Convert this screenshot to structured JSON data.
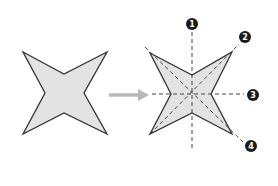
{
  "diagram": {
    "colors": {
      "fill": "#e3e3e3",
      "stroke": "#333333",
      "arrow": "#b8b8b8",
      "dashed_line": "#444444",
      "badge": "#1a1a1a",
      "badge_text": "#ffffff"
    },
    "left_shape": {
      "label": "original star"
    },
    "arrow": {
      "label": "transform arrow"
    },
    "right_shape": {
      "label": "star with symmetry lines"
    },
    "symmetry_lines": [
      {
        "id": "1",
        "label": "1",
        "orientation": "vertical"
      },
      {
        "id": "2",
        "label": "2",
        "orientation": "diagonal-up"
      },
      {
        "id": "3",
        "label": "3",
        "orientation": "horizontal"
      },
      {
        "id": "4",
        "label": "4",
        "orientation": "diagonal-down"
      }
    ]
  }
}
